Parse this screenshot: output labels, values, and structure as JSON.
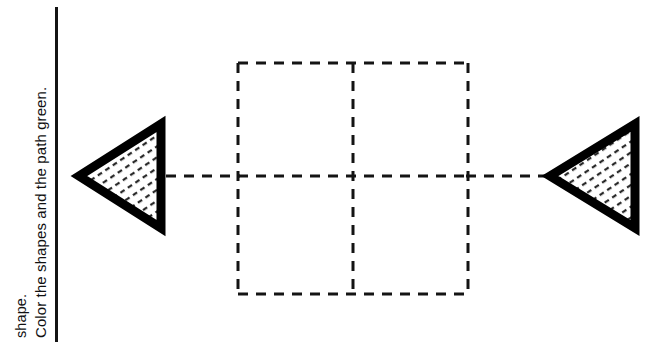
{
  "page": {
    "width": 672,
    "height": 342,
    "background_color": "#ffffff",
    "ink_color": "#141414"
  },
  "instructions": {
    "line_1": "shape.",
    "line_2": "Color the shapes and the path green.",
    "orientation": "rotated-90-counterclockwise"
  },
  "margin_rule": {
    "color": "#141414",
    "x": 55,
    "top": 7,
    "bottom": 342,
    "thickness": 3
  },
  "shapes": [
    {
      "name": "left-triangle",
      "kind": "triangle",
      "direction": "points-left",
      "outline_color": "#000000",
      "outline_width": 9,
      "fill": "diagonal-dash-hatch",
      "fill_background": "#ffffff",
      "tip": {
        "x": 77,
        "y": 176
      },
      "top_vertex": {
        "x": 163,
        "y": 122
      },
      "bottom_vertex": {
        "x": 163,
        "y": 230
      }
    },
    {
      "name": "right-triangle",
      "kind": "triangle",
      "direction": "points-left",
      "outline_color": "#000000",
      "outline_width": 9,
      "fill": "diagonal-dash-hatch",
      "fill_background": "#ffffff",
      "tip": {
        "x": 548,
        "y": 176
      },
      "top_vertex": {
        "x": 638,
        "y": 122
      },
      "bottom_vertex": {
        "x": 638,
        "y": 230
      }
    }
  ],
  "grid": {
    "name": "dashed-square-grid",
    "rows": 2,
    "columns": 2,
    "left": 238,
    "top": 63,
    "right": 468,
    "bottom": 294,
    "mid_x": 353,
    "mid_y": 176,
    "stroke_color": "#141414",
    "stroke_width": 3,
    "dash_length": 10,
    "dash_gap": 8
  },
  "path": {
    "name": "dashed-connector-path",
    "y": 176,
    "left_segment": {
      "from_x": 166,
      "to_x": 238
    },
    "right_segment": {
      "from_x": 468,
      "to_x": 546
    },
    "stroke_color": "#141414",
    "stroke_width": 3,
    "dash_length": 10,
    "dash_gap": 8
  },
  "hatch": {
    "pattern": "short-diagonal-dashes",
    "color": "#1a1a1a",
    "tile": 9
  }
}
